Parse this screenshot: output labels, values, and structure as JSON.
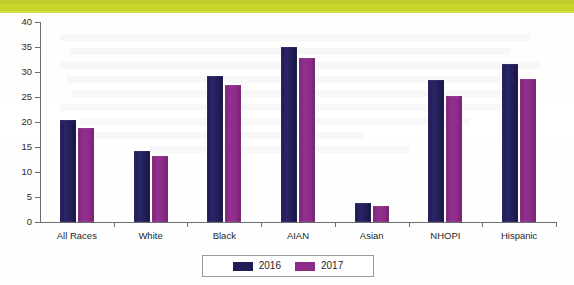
{
  "banner": {
    "name": "top-color-band",
    "color": "#c8d42a"
  },
  "chart_data": {
    "type": "bar",
    "title": "",
    "subtitle": "",
    "xlabel": "",
    "ylabel": "",
    "categories": [
      "All Races",
      "White",
      "Black",
      "AIAN",
      "Asian",
      "NHOPI",
      "Hispanic"
    ],
    "series": [
      {
        "name": "2016",
        "color": "#221d57",
        "values": [
          20.3,
          14.2,
          29.2,
          35.0,
          3.7,
          28.4,
          31.6
        ]
      },
      {
        "name": "2017",
        "color": "#8c2c88",
        "values": [
          18.8,
          13.1,
          27.4,
          32.8,
          3.1,
          25.2,
          28.6
        ]
      }
    ],
    "ylim": [
      0,
      40
    ],
    "yticks": [
      0,
      5,
      10,
      15,
      20,
      25,
      30,
      35,
      40
    ],
    "ytick_labels": [
      "0",
      "5",
      "10",
      "15",
      "20",
      "25",
      "30",
      "35",
      "40"
    ],
    "grid": false,
    "legend": {
      "position": "bottom",
      "entries": [
        {
          "label": "2016",
          "color": "#221d57"
        },
        {
          "label": "2017",
          "color": "#8c2c88"
        }
      ]
    }
  }
}
